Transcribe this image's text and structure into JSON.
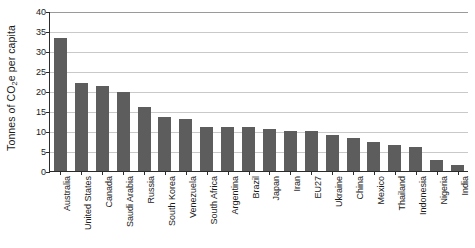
{
  "chart_data": {
    "type": "bar",
    "title": "",
    "xlabel": "",
    "ylabel": "Tonnes of CO2e per capita",
    "ylabel_parts": {
      "before": "Tonnes of CO",
      "sub": "2",
      "after": "e per capita"
    },
    "ylim": [
      0,
      40
    ],
    "ytick_step": 5,
    "yticks": [
      "0",
      "5",
      "10",
      "15",
      "20",
      "25",
      "30",
      "35",
      "40"
    ],
    "grid": true,
    "legend": "none",
    "bar_color": "#5d5d5d",
    "gridline_color": "#c9c9c9",
    "axis_color": "#2b2b2b",
    "categories": [
      "Australia",
      "United States",
      "Canada",
      "Saudi Arabia",
      "Russia",
      "South Korea",
      "Venezuela",
      "South Africa",
      "Argentina",
      "Brazil",
      "Japan",
      "Iran",
      "EU27",
      "Ukraine",
      "China",
      "Mexico",
      "Thailand",
      "Indonesia",
      "Nigeria",
      "India"
    ],
    "values": [
      33.3,
      21.9,
      21.3,
      19.7,
      16.1,
      13.6,
      13.1,
      11.0,
      11.0,
      10.9,
      10.4,
      10.1,
      10.0,
      9.0,
      8.2,
      7.3,
      6.4,
      6.0,
      2.7,
      1.6
    ]
  }
}
